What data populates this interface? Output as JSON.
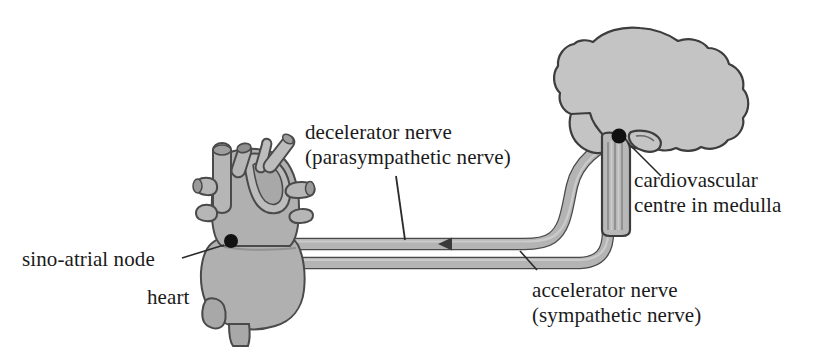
{
  "diagram": {
    "background_color": "#ffffff",
    "organ_fill": "#b0b0b0",
    "brain_fill": "#c4c4c4",
    "nerve_fill": "#b4b4b4",
    "outline_color": "#4a4a4a",
    "node_color": "#111111",
    "text_color": "#1a1a1a"
  },
  "labels": {
    "decelerator": {
      "line1": "decelerator nerve",
      "line2": "(parasympathetic nerve)"
    },
    "accelerator": {
      "line1": "accelerator nerve",
      "line2": "(sympathetic nerve)"
    },
    "cardiovascular": {
      "line1": "cardiovascular",
      "line2": "centre in medulla"
    },
    "sino_atrial": {
      "line1": "sino-atrial node"
    },
    "heart": {
      "line1": "heart"
    }
  },
  "structures": {
    "heart": "heart-organ",
    "brain": "brain-organ",
    "medulla": "medulla-brainstem",
    "sa_node": "sino-atrial-node-marker",
    "cv_centre": "cardiovascular-centre-marker",
    "parasympathetic_nerve": "decelerator-nerve-path",
    "sympathetic_nerve": "accelerator-nerve-path",
    "signal_arrow": "signal-direction-arrow"
  }
}
